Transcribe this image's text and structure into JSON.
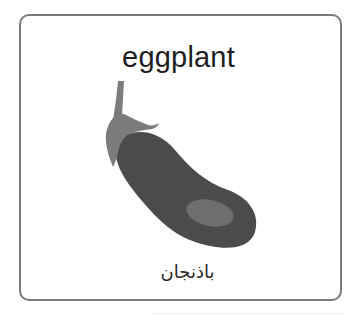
{
  "card": {
    "title": "eggplant",
    "subtitle": "باذنجان",
    "image": {
      "icon": "eggplant-icon",
      "colors": {
        "body": "#4b4b4b",
        "highlight": "#6e6e6e",
        "calyx": "#7c7c7c"
      }
    }
  },
  "colors": {
    "border": "#7a7a7a",
    "text": "#1e1e1e",
    "background": "#ffffff"
  }
}
